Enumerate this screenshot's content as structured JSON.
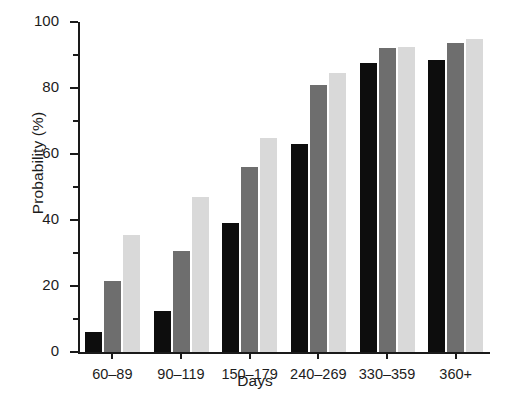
{
  "chart_data": {
    "type": "bar",
    "title": "",
    "xlabel": "Days",
    "ylabel": "Probability (%)",
    "ylim": [
      0,
      100
    ],
    "ytick_major": [
      0,
      20,
      40,
      60,
      80,
      100
    ],
    "ytick_minor": [
      10,
      30,
      50,
      70,
      90
    ],
    "ytick_labels": [
      "0",
      "20",
      "40",
      "60",
      "80",
      "100"
    ],
    "grid": false,
    "legend": "none",
    "categories": [
      "60–89",
      "90–119",
      "150–179",
      "240–269",
      "330–359",
      "360+"
    ],
    "series": [
      {
        "name": "series-1",
        "color": "#0d0d0d",
        "values": [
          6,
          12.5,
          39,
          63,
          87.5,
          88.5
        ]
      },
      {
        "name": "series-2",
        "color": "#6e6e6e",
        "values": [
          21.5,
          30.5,
          56,
          81,
          92,
          93.5
        ]
      },
      {
        "name": "series-3",
        "color": "#d9d9d9",
        "values": [
          35.5,
          47,
          65,
          84.5,
          92.5,
          95
        ]
      }
    ]
  }
}
